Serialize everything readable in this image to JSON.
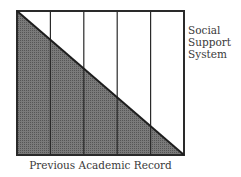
{
  "diagram": {
    "side_label_lines": [
      "Social",
      "Support",
      "System"
    ],
    "bottom_label": "Previous Academic Record",
    "columns": 5,
    "colors": {
      "border": "#2a2a2a",
      "shade": "#6e6e6e",
      "background": "#ffffff"
    }
  }
}
